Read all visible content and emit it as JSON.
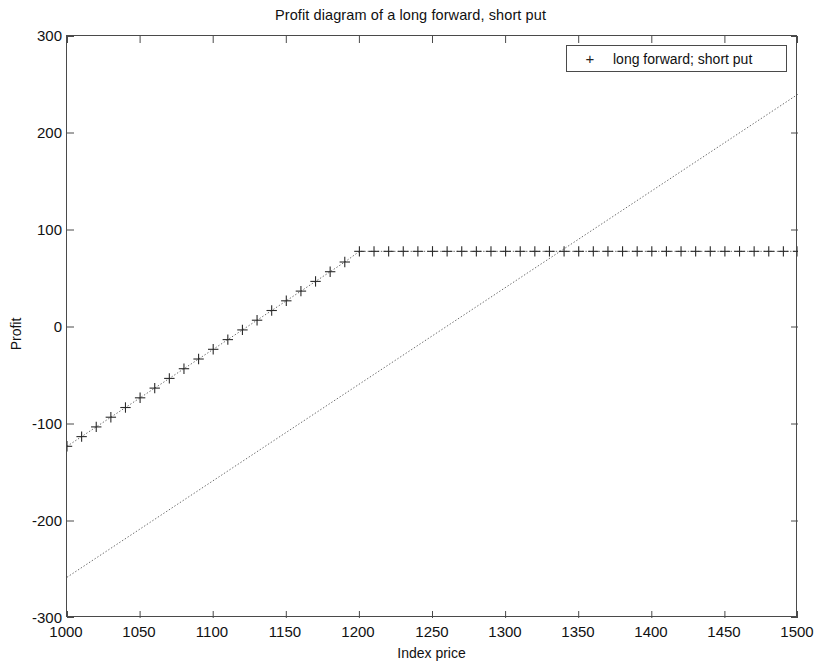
{
  "chart_data": {
    "type": "line",
    "title": "Profit diagram of a long forward, short put",
    "xlabel": "Index price",
    "ylabel": "Profit",
    "xlim": [
      1000,
      1500
    ],
    "ylim": [
      -300,
      300
    ],
    "xticks": [
      1000,
      1050,
      1100,
      1150,
      1200,
      1250,
      1300,
      1350,
      1400,
      1450,
      1500
    ],
    "yticks": [
      300,
      200,
      100,
      0,
      -100,
      -200,
      -300
    ],
    "grid": false,
    "legend": {
      "position": "top-right",
      "entries": [
        {
          "marker": "+",
          "label": "long forward; short put"
        }
      ]
    },
    "series": [
      {
        "name": "long forward",
        "style": "dotted",
        "marker": "none",
        "x": [
          1000,
          1500
        ],
        "values": [
          -258,
          240
        ]
      },
      {
        "name": "long forward; short put",
        "style": "dotted-with-markers",
        "marker": "+",
        "marker_step": 10,
        "kink_x": 1200,
        "plateau_value": 78,
        "x": [
          1000,
          1010,
          1020,
          1030,
          1040,
          1050,
          1060,
          1070,
          1080,
          1090,
          1100,
          1110,
          1120,
          1130,
          1140,
          1150,
          1160,
          1170,
          1180,
          1190,
          1200,
          1210,
          1220,
          1230,
          1240,
          1250,
          1260,
          1270,
          1280,
          1290,
          1300,
          1310,
          1320,
          1330,
          1340,
          1350,
          1360,
          1370,
          1380,
          1390,
          1400,
          1410,
          1420,
          1430,
          1440,
          1450,
          1460,
          1470,
          1480,
          1490,
          1500
        ],
        "values": [
          -123,
          -113,
          -103,
          -93,
          -83,
          -73,
          -63,
          -53,
          -43,
          -33,
          -23,
          -13,
          -3,
          7,
          17,
          27,
          37,
          47,
          57,
          67,
          78,
          78,
          78,
          78,
          78,
          78,
          78,
          78,
          78,
          78,
          78,
          78,
          78,
          78,
          78,
          78,
          78,
          78,
          78,
          78,
          78,
          78,
          78,
          78,
          78,
          78,
          78,
          78,
          78,
          78,
          78
        ]
      }
    ]
  },
  "figure": {
    "background_color": "#ffffff",
    "axis_color": "#4a4a4a",
    "line_color": "#5a5a5a",
    "marker_color": "#2a2a2a"
  }
}
